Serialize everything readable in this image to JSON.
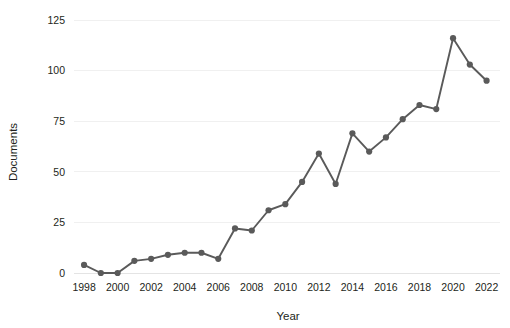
{
  "chart_data": {
    "type": "line",
    "title": "",
    "xlabel": "Year",
    "ylabel": "Documents",
    "x": [
      1998,
      1999,
      2000,
      2001,
      2002,
      2003,
      2004,
      2005,
      2006,
      2007,
      2008,
      2009,
      2010,
      2011,
      2012,
      2013,
      2014,
      2015,
      2016,
      2017,
      2018,
      2019,
      2020,
      2021,
      2022
    ],
    "values": [
      4,
      0,
      0,
      6,
      7,
      9,
      10,
      10,
      7,
      22,
      21,
      31,
      34,
      45,
      59,
      44,
      69,
      60,
      67,
      76,
      83,
      81,
      116,
      103,
      95
    ],
    "series": [
      {
        "name": "Documents",
        "values": [
          4,
          0,
          0,
          6,
          7,
          9,
          10,
          10,
          7,
          22,
          21,
          31,
          34,
          45,
          59,
          44,
          69,
          60,
          67,
          76,
          83,
          81,
          116,
          103,
          95
        ]
      }
    ],
    "xlim": [
      1997.4,
      2022.8
    ],
    "ylim": [
      0,
      125
    ],
    "xticks": [
      1998,
      2000,
      2002,
      2004,
      2006,
      2008,
      2010,
      2012,
      2014,
      2016,
      2018,
      2020,
      2022
    ],
    "xtick_labels": [
      "1998",
      "2000",
      "2002",
      "2004",
      "2006",
      "2008",
      "2010",
      "2012",
      "2014",
      "2016",
      "2018",
      "2020",
      "2022"
    ],
    "yticks": [
      0,
      25,
      50,
      75,
      100,
      125
    ],
    "ytick_labels": [
      "0",
      "25",
      "50",
      "75",
      "100",
      "125"
    ],
    "grid": true,
    "grid_axis": "y",
    "legend": false,
    "legend_position": "none",
    "marker": "circle",
    "colors": {
      "line": "#5a5a5a",
      "marker": "#5a5a5a",
      "grid": "#f0f0f0",
      "text": "#231f20",
      "background": "#ffffff"
    }
  }
}
